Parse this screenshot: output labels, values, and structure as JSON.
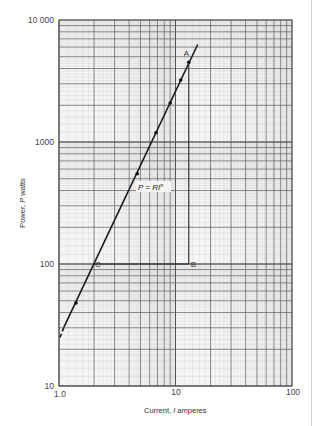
{
  "chart_data": {
    "type": "line",
    "title": "",
    "xlabel": "Current, I amperes",
    "ylabel": "Power, P watts",
    "xscale": "log",
    "yscale": "log",
    "xlim": [
      1.0,
      100
    ],
    "ylim": [
      10,
      10000
    ],
    "grid": true,
    "x_tick_labels": [
      "1.0",
      "10",
      "100"
    ],
    "y_tick_labels": [
      "10",
      "100",
      "1000",
      "10 000"
    ],
    "series": [
      {
        "name": "P = RI^n",
        "formula": "P = RIⁿ",
        "fit": {
          "R": 25,
          "n": 2
        },
        "x": [
          1.0,
          1.4,
          4.7,
          6.8,
          9.0,
          11.1,
          13.0,
          15.5
        ],
        "y": [
          25,
          48,
          550,
          1190,
          2090,
          3220,
          4500,
          6300
        ],
        "markers": [
          {
            "x": 1.4,
            "y": 48
          },
          {
            "x": 4.7,
            "y": 550
          },
          {
            "x": 6.8,
            "y": 1190
          },
          {
            "x": 9.0,
            "y": 2090
          },
          {
            "x": 11.1,
            "y": 3220
          },
          {
            "x": 13.0,
            "y": 4500
          }
        ],
        "dashed_extension": {
          "x": [
            1.0,
            1.1
          ],
          "y": [
            25,
            30
          ]
        }
      }
    ],
    "annotations": [
      {
        "label": "A",
        "x": 13.0,
        "y": 4500
      },
      {
        "label": "B",
        "x": 13.0,
        "y": 100
      },
      {
        "label": "C",
        "x": 2.0,
        "y": 100
      }
    ],
    "slope_triangle": {
      "from": "C",
      "corner": "B",
      "to": "A"
    }
  },
  "labels": {
    "x_axis": "Current, I amperes",
    "x_axis_prefix": "Current, ",
    "x_axis_var": "I",
    "x_axis_unit": " amperes",
    "y_axis_prefix": "Power, ",
    "y_axis_var": "P",
    "y_axis_unit": " watts",
    "formula_left": "P = RI",
    "formula_exp": "n",
    "point_a": "A",
    "point_b": "B",
    "point_c": "C",
    "x_ticks": [
      "1.0",
      "10",
      "100"
    ],
    "y_ticks": [
      "10",
      "100",
      "1000",
      "10 000"
    ]
  },
  "colors": {
    "grid_minor": "#c9c9c9",
    "grid_major": "#555555",
    "line": "#1a1a1a",
    "background": "#f4f4f4"
  }
}
